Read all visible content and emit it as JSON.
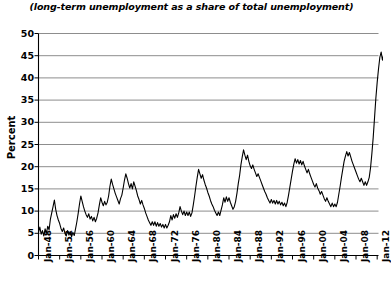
{
  "chart_data": {
    "type": "line",
    "title": "(long-term unemployment as a share of total unemployment)",
    "xlabel": "",
    "ylabel": "Percent",
    "ylim": [
      0,
      50
    ],
    "ytick_step": 5,
    "yticks": [
      "0",
      "5",
      "10",
      "15",
      "20",
      "25",
      "30",
      "35",
      "40",
      "45",
      "50"
    ],
    "grid": "horizontal",
    "legend": "none",
    "xlim": [
      "Jan-48",
      "Jan-12"
    ],
    "xticks": [
      "Jan-48",
      "Jan-52",
      "Jan-56",
      "Jan-60",
      "Jan-64",
      "Jan-68",
      "Jan-72",
      "Jan-76",
      "Jan-80",
      "Jan-84",
      "Jan-88",
      "Jan-92",
      "Jan-96",
      "Jan-00",
      "Jan-04",
      "Jan-08",
      "Jan-12"
    ],
    "series": [
      {
        "name": "long-term unemployment share",
        "color": "#000000",
        "x_start_year": 1948.0,
        "x_end_year": 2012.25,
        "x_step_years": 0.25,
        "values": [
          5.2,
          6.4,
          4.8,
          5.6,
          4.4,
          6.0,
          5.0,
          6.6,
          5.8,
          8.2,
          9.6,
          11.0,
          12.5,
          10.4,
          9.0,
          8.0,
          7.2,
          6.1,
          5.4,
          6.2,
          5.0,
          4.4,
          5.6,
          4.6,
          5.4,
          4.2,
          5.2,
          4.5,
          6.0,
          7.6,
          9.5,
          11.6,
          13.4,
          12.2,
          11.0,
          10.0,
          9.2,
          8.6,
          9.4,
          8.2,
          8.8,
          7.8,
          8.6,
          7.6,
          8.4,
          9.6,
          11.4,
          13.0,
          12.0,
          11.2,
          12.2,
          11.4,
          12.0,
          13.4,
          15.6,
          17.2,
          16.0,
          15.0,
          14.0,
          13.2,
          12.4,
          11.6,
          12.8,
          13.6,
          15.2,
          17.0,
          18.4,
          17.4,
          16.2,
          15.2,
          16.2,
          15.0,
          16.6,
          15.6,
          14.6,
          13.4,
          12.6,
          11.6,
          12.4,
          11.4,
          10.6,
          9.6,
          8.8,
          8.0,
          7.4,
          6.8,
          7.6,
          6.8,
          7.6,
          6.6,
          7.4,
          6.6,
          7.2,
          6.4,
          7.0,
          6.2,
          7.0,
          6.2,
          6.8,
          7.6,
          9.0,
          8.0,
          9.2,
          8.4,
          9.4,
          8.6,
          9.6,
          11.0,
          10.0,
          9.2,
          10.0,
          9.0,
          9.8,
          9.0,
          9.8,
          8.8,
          9.6,
          11.4,
          13.4,
          15.6,
          17.6,
          19.4,
          18.4,
          17.4,
          18.2,
          17.0,
          16.0,
          15.2,
          14.2,
          13.4,
          12.4,
          11.6,
          11.0,
          10.2,
          9.6,
          9.0,
          9.8,
          9.0,
          10.2,
          11.4,
          13.0,
          12.0,
          13.2,
          12.2,
          13.0,
          12.0,
          11.2,
          10.4,
          11.0,
          12.2,
          14.0,
          16.2,
          18.0,
          20.4,
          22.2,
          23.8,
          22.6,
          21.6,
          22.6,
          21.2,
          20.2,
          19.6,
          20.4,
          19.4,
          18.6,
          17.8,
          18.4,
          17.6,
          16.8,
          16.0,
          15.2,
          14.4,
          13.8,
          13.0,
          12.4,
          11.8,
          12.6,
          11.8,
          12.4,
          11.6,
          12.4,
          11.6,
          12.2,
          11.4,
          12.0,
          11.2,
          11.8,
          11.0,
          12.0,
          13.6,
          15.4,
          17.2,
          19.0,
          20.6,
          21.8,
          20.8,
          21.6,
          20.6,
          21.4,
          20.4,
          21.2,
          20.2,
          19.4,
          18.6,
          19.4,
          18.4,
          17.6,
          16.8,
          16.0,
          15.4,
          16.2,
          15.2,
          14.6,
          13.8,
          14.4,
          13.6,
          12.8,
          12.2,
          13.0,
          12.2,
          11.6,
          11.0,
          11.8,
          11.0,
          11.6,
          11.0,
          12.0,
          13.8,
          15.6,
          17.6,
          19.4,
          21.2,
          22.4,
          23.4,
          22.4,
          23.2,
          22.2,
          21.2,
          20.4,
          19.6,
          18.8,
          18.0,
          17.2,
          16.6,
          17.4,
          16.6,
          15.8,
          16.6,
          15.8,
          16.6,
          17.6,
          19.8,
          23.0,
          26.6,
          31.0,
          35.4,
          39.0,
          42.0,
          44.6,
          45.8,
          44.0,
          45.4,
          43.6,
          44.8,
          42.8,
          41.2
        ],
        "peaks": [
          {
            "label": "1950 peak",
            "value": 12.5
          },
          {
            "label": "1958 peak",
            "value": 13.4
          },
          {
            "label": "1961 peak",
            "value": 17.2
          },
          {
            "label": "1963 peak",
            "value": 18.4
          },
          {
            "label": "1976 peak",
            "value": 19.4
          },
          {
            "label": "1983 peak",
            "value": 23.8
          },
          {
            "label": "1994 peak",
            "value": 21.8
          },
          {
            "label": "2003 peak",
            "value": 23.4
          },
          {
            "label": "2010 peak",
            "value": 45.8
          }
        ],
        "end_value": 41.2
      }
    ]
  }
}
